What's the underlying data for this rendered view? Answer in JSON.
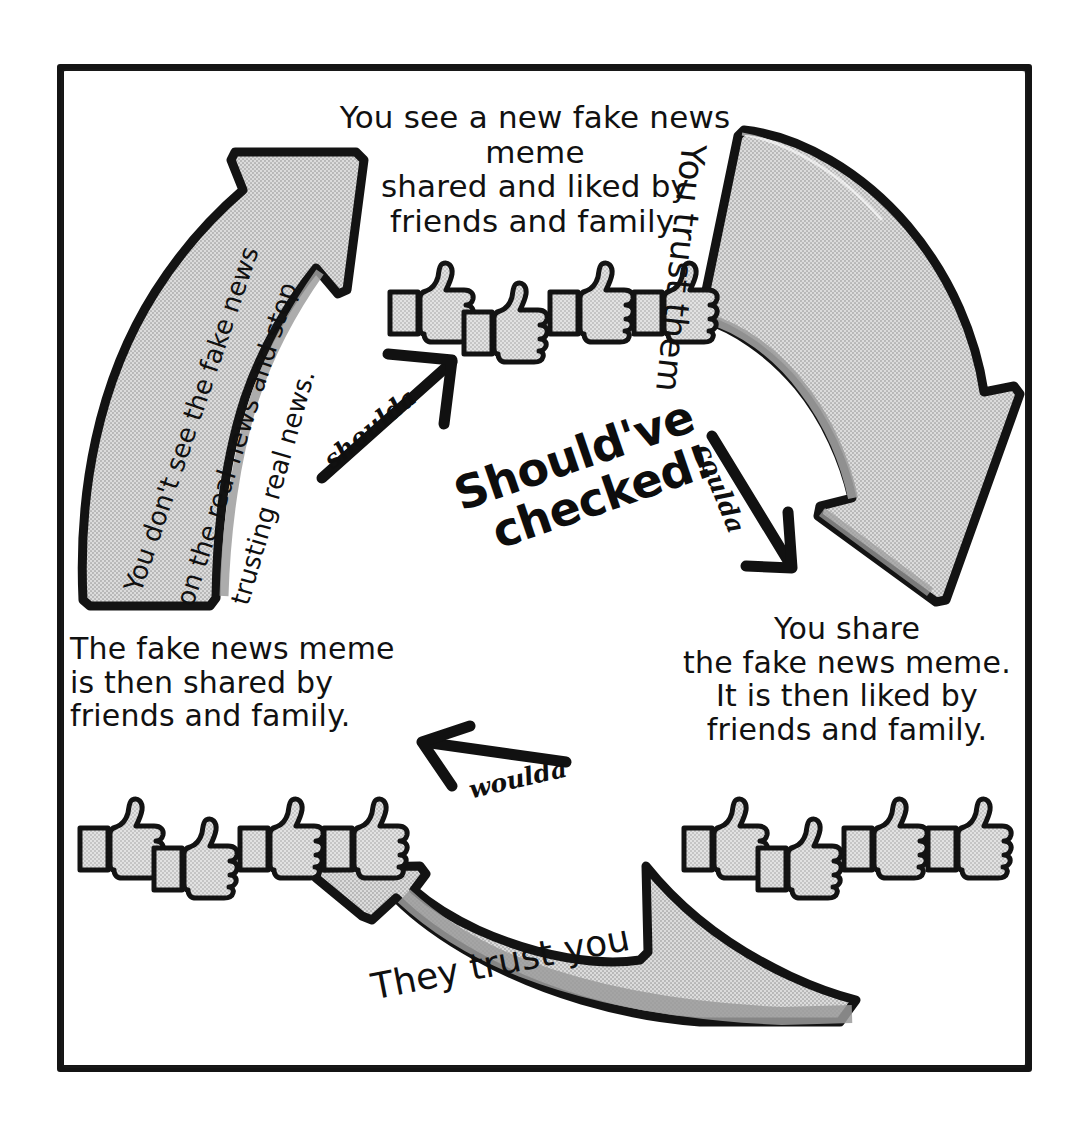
{
  "diagram": {
    "center_slogan": {
      "line1": "Should've",
      "line2": "checked!"
    },
    "colors": {
      "ink": "#141414",
      "arrow_fill": "#d2d2d2",
      "arrow_shade": "#a9a9a9",
      "thumb_fill": "#d4d4d4",
      "paper": "#ffffff"
    },
    "nodes": [
      {
        "id": "node-top",
        "text": "You see a new fake news meme\nshared and liked by\nfriends and family.",
        "likes": 4
      },
      {
        "id": "node-right",
        "text": "You  share\nthe fake news meme.\nIt is then  liked by\nfriends and family.",
        "likes": 4
      },
      {
        "id": "node-bottom-left",
        "text": "The fake news meme\nis then shared by\nfriends and family.",
        "likes": 4
      }
    ],
    "big_arrows": [
      {
        "id": "arrow-right",
        "label": "You trust them",
        "direction": "clockwise-down"
      },
      {
        "id": "arrow-bottom",
        "label": "They trust you",
        "direction": "right-to-left"
      },
      {
        "id": "arrow-left",
        "direction": "up",
        "label_lines": [
          "You don't see the fake news",
          "on the real news and stop",
          "trusting real news."
        ]
      }
    ],
    "mini_arrows": [
      {
        "id": "mini-shoulda",
        "label": "shoulda",
        "points": "up-right"
      },
      {
        "id": "mini-coulda",
        "label": "coulda",
        "points": "down-right"
      },
      {
        "id": "mini-woulda",
        "label": "woulda",
        "points": "left"
      }
    ],
    "icons": {
      "thumbs_up": "thumbs-up-icon",
      "frame": "sketch-border"
    }
  }
}
